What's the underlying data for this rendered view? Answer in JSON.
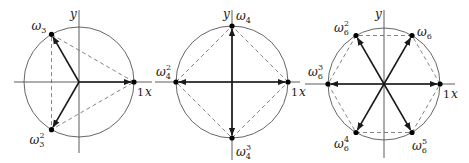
{
  "colors": {
    "axis": "#333333",
    "circle": "#555555",
    "vector": "#1a1a1a",
    "dashed": "#666666",
    "point": "#000000"
  },
  "diagrams": [
    {
      "name": "cube-roots-of-unity",
      "n": 3,
      "center": [
        79,
        82
      ],
      "radius": 55,
      "axis_x": [
        14,
        152
      ],
      "axis_y": [
        10,
        153
      ],
      "y_label": "y",
      "x_label": "x",
      "one_label": "1",
      "points": [
        {
          "label": "ω",
          "sub": "3",
          "sup": "",
          "angle": 0,
          "lx": 0,
          "ly": 0,
          "show_label": false
        },
        {
          "label": "ω",
          "sub": "3",
          "sup": "",
          "angle": 120,
          "lx": -20,
          "ly": -4
        },
        {
          "label": "ω",
          "sub": "3",
          "sup": "2",
          "angle": 240,
          "lx": -22,
          "ly": 14
        }
      ]
    },
    {
      "name": "fourth-roots-of-unity",
      "n": 4,
      "center": [
        232,
        82
      ],
      "radius": 56,
      "axis_x": [
        155,
        300
      ],
      "axis_y": [
        10,
        160
      ],
      "y_label": "y",
      "x_label": "x",
      "one_label": "1",
      "points": [
        {
          "label": "ω",
          "sub": "4",
          "sup": "",
          "angle": 0,
          "show_label": false
        },
        {
          "label": "ω",
          "sub": "4",
          "sup": "",
          "angle": 90,
          "lx": 4,
          "ly": -6
        },
        {
          "label": "ω",
          "sub": "4",
          "sup": "2",
          "angle": 180,
          "lx": -20,
          "ly": -6
        },
        {
          "label": "ω",
          "sub": "4",
          "sup": "3",
          "angle": 270,
          "lx": 4,
          "ly": 18
        }
      ]
    },
    {
      "name": "sixth-roots-of-unity",
      "n": 6,
      "center": [
        384,
        84
      ],
      "radius": 56,
      "axis_x": [
        305,
        455
      ],
      "axis_y": [
        10,
        158
      ],
      "y_label": "y",
      "x_label": "x",
      "one_label": "1",
      "points": [
        {
          "label": "ω",
          "sub": "6",
          "sup": "",
          "angle": 0,
          "show_label": false
        },
        {
          "label": "ω",
          "sub": "6",
          "sup": "",
          "angle": 60,
          "lx": 5,
          "ly": 0
        },
        {
          "label": "ω",
          "sub": "6",
          "sup": "2",
          "angle": 120,
          "lx": -22,
          "ly": -4
        },
        {
          "label": "ω",
          "sub": "6",
          "sup": "3",
          "angle": 180,
          "lx": -20,
          "ly": -8
        },
        {
          "label": "ω",
          "sub": "6",
          "sup": "4",
          "angle": 240,
          "lx": -22,
          "ly": 16
        },
        {
          "label": "ω",
          "sub": "6",
          "sup": "5",
          "angle": 300,
          "lx": 0,
          "ly": 18
        }
      ]
    }
  ]
}
